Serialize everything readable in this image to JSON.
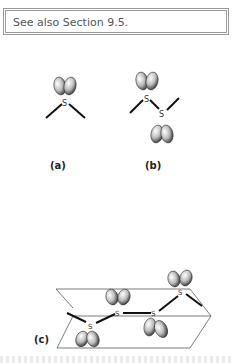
{
  "note": {
    "text": "See also Section 9.5."
  },
  "figure": {
    "panels": [
      {
        "label": "(a)",
        "description": "Single sulfur atom with two bonds and a lone-pair orbital lobe pointing up"
      },
      {
        "label": "(b)",
        "description": "Two linked sulfur atoms, lone-pair lobes pointing up and down"
      },
      {
        "label": "(c)",
        "description": "Chain of four sulfur atoms spanning two planes, with alternating lone-pair lobes"
      }
    ],
    "atom_symbol": "S"
  }
}
